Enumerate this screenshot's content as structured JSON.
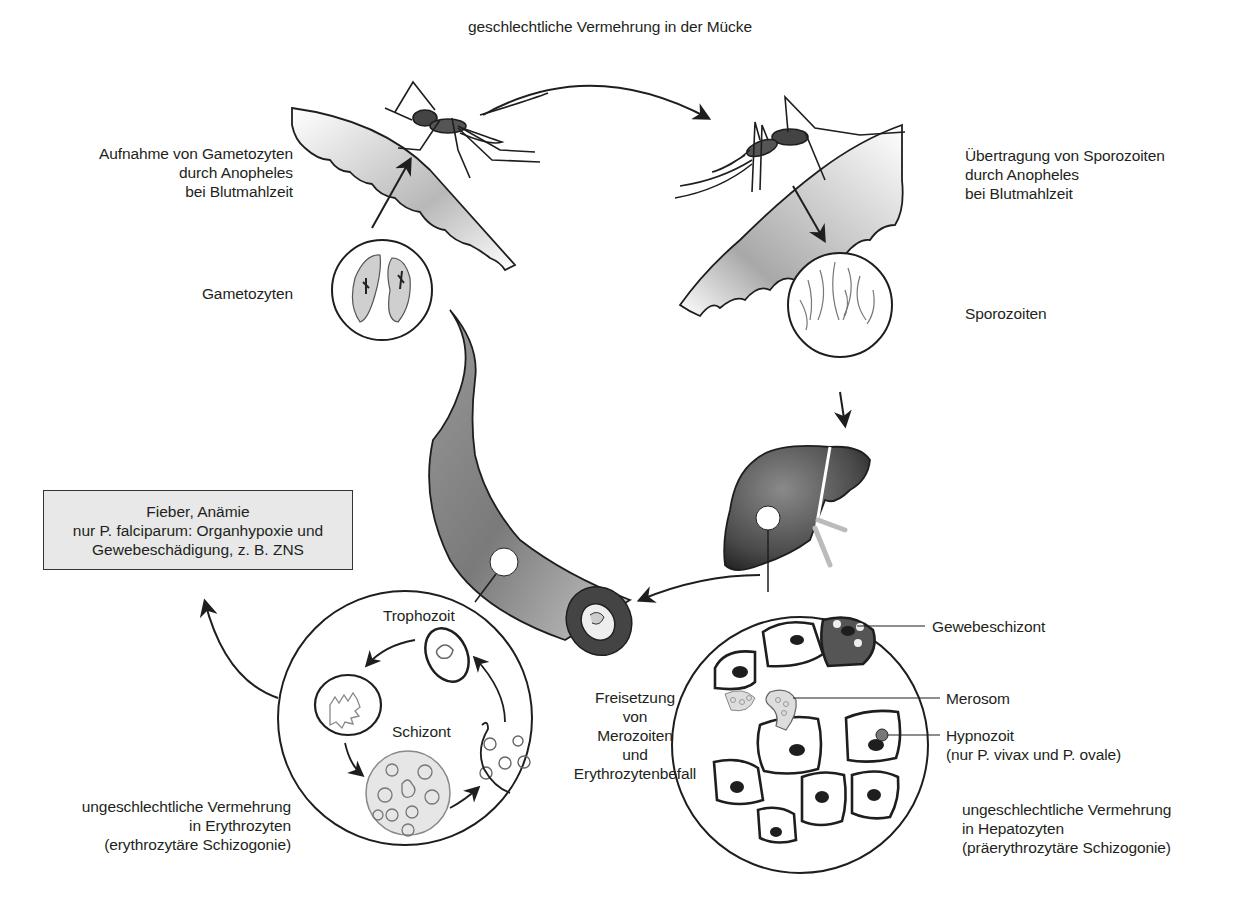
{
  "diagram": {
    "colors": {
      "line": "#1e1e1e",
      "shade_dark": "#555555",
      "shade_mid": "#8a8a8a",
      "shade_light": "#d4d4d4",
      "box_fill": "#e8e8e8",
      "background": "#ffffff"
    },
    "labels": {
      "top_arrow": "geschlechtliche Vermehrung in der Mücke",
      "uptake": [
        "Aufnahme von Gametozyten",
        "durch Anopheles",
        "bei Blutmahlzeit"
      ],
      "transmission": [
        "Übertragung von Sporozoiten",
        "durch Anopheles",
        "bei Blutmahlzeit"
      ],
      "gametocytes": "Gametozyten",
      "sporozoites": "Sporozoiten",
      "symptoms": [
        "Fieber, Anämie",
        "nur P. falciparum: Organhypoxie und",
        "Gewebeschädigung, z. B. ZNS"
      ],
      "trophozoite": "Trophozoit",
      "schizont": "Schizont",
      "release": [
        "Freisetzung",
        "von",
        "Merozoiten",
        "und",
        "Erythrozytenbefall"
      ],
      "tissue_schizont": "Gewebeschizont",
      "merosome": "Merosom",
      "hypnozoite": [
        "Hypnozoit",
        "(nur P. vivax und P. ovale)"
      ],
      "erythrocytic": [
        "ungeschlechtliche Vermehrung",
        "in Erythrozyten",
        "(erythrozytäre Schizogonie)"
      ],
      "hepatic": [
        "ungeschlechtliche Vermehrung",
        "in Hepatozyten",
        "(präerythrozytäre Schizogonie)"
      ]
    },
    "nodes": [
      {
        "id": "mosquito-left",
        "icon": "mosquito-icon"
      },
      {
        "id": "mosquito-right",
        "icon": "mosquito-icon"
      },
      {
        "id": "gametocytes-circle",
        "icon": "gametocyte-cells-icon"
      },
      {
        "id": "sporozoites-circle",
        "icon": "sporozoite-cells-icon"
      },
      {
        "id": "liver",
        "icon": "liver-icon"
      },
      {
        "id": "blood-vessel",
        "icon": "blood-vessel-icon"
      },
      {
        "id": "erythrocyte-cycle-circle",
        "icon": "erythrocyte-cycle-icon"
      },
      {
        "id": "hepatocyte-circle",
        "icon": "hepatocyte-cells-icon"
      }
    ]
  }
}
